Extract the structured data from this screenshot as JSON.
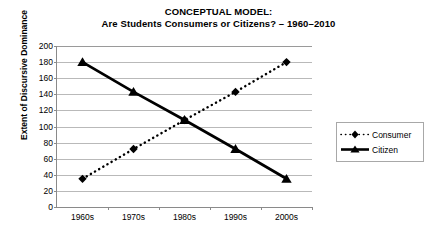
{
  "chart_data": {
    "type": "line",
    "title": "CONCEPTUAL MODEL:\nAre Students Consumers or Citizens? – 1960–2010",
    "title_lines": [
      "CONCEPTUAL MODEL:",
      "Are Students Consumers or Citizens? – 1960–2010"
    ],
    "xlabel": "",
    "ylabel": "Extent of Discursive Dominance",
    "categories": [
      "1960s",
      "1970s",
      "1980s",
      "1990s",
      "2000s"
    ],
    "series": [
      {
        "name": "Consumer",
        "values": [
          35,
          72,
          108,
          143,
          180
        ],
        "style": "dotted",
        "marker": "diamond",
        "color": "#000000"
      },
      {
        "name": "Citizen",
        "values": [
          180,
          143,
          108,
          72,
          35
        ],
        "style": "solid",
        "marker": "triangle",
        "color": "#000000"
      }
    ],
    "ylim": [
      0,
      200
    ],
    "ytick_values": [
      0,
      20,
      40,
      60,
      80,
      100,
      120,
      140,
      160,
      180,
      200
    ],
    "ytick_labels": [
      "0",
      "20",
      "40",
      "60",
      "80",
      "100",
      "120",
      "140",
      "160",
      "180",
      "200"
    ],
    "grid": true,
    "grid_axis": "y",
    "legend_position": "right",
    "legend_entries": [
      "Consumer",
      "Citizen"
    ],
    "background_color": "#ffffff",
    "gridline_color": "#b9b9b9",
    "axis_color": "#8a8a8a"
  }
}
